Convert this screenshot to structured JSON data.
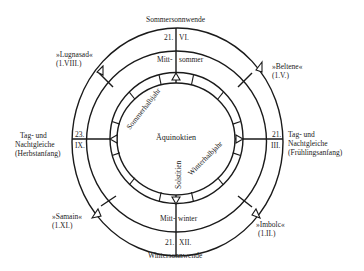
{
  "diagram": {
    "title_top": "Sommersonnwende",
    "title_bottom": "Wintersonnwende",
    "solstice_summer": {
      "day": "21.",
      "month": "VI.",
      "label_left": "Mitt-",
      "label_right": "sommer"
    },
    "solstice_winter": {
      "day": "21.",
      "month": "XII.",
      "label_left": "Mitt-",
      "label_right": "winter"
    },
    "equinox_autumn": {
      "day": "23.",
      "month": "IX.",
      "line1": "Tag- und",
      "line2": "Nachtgleiche",
      "line3": "(Herbstanfang)"
    },
    "equinox_spring": {
      "day": "21.",
      "month": "III.",
      "line1": "Tag- und",
      "line2": "Nachtgleiche",
      "line3": "(Frühlingsanfang)"
    },
    "festivals": [
      {
        "name": "»Lugnasad«",
        "date": "(1.VIII.)"
      },
      {
        "name": "»Beltene«",
        "date": "(1.V.)"
      },
      {
        "name": "»Samain«",
        "date": "(1.XI.)"
      },
      {
        "name": "»Imbolc«",
        "date": "(1.II.)"
      }
    ],
    "inner": {
      "center": "Äquinoktien",
      "summer_half": "Sommerhalbjahr",
      "winter_half": "Winterhalbjahr",
      "solstices": "Solstitien"
    },
    "colors": {
      "line": "#1a1a1a",
      "background": "#ffffff"
    }
  }
}
